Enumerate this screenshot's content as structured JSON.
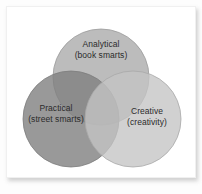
{
  "figure": {
    "name": "triarchic-intelligence-venn-diagram",
    "type": "venn-diagram-three-set",
    "background_color": "#ffffff",
    "panel_color": "#ffffff",
    "panel_border_color": "#f0f0f0",
    "label_text_color": "#2b2b2b"
  },
  "chart_data": {
    "type": "venn",
    "title": "",
    "sets": [
      {
        "id": "analytical",
        "label": "Analytical",
        "sublabel": "(book smarts)",
        "position": "top",
        "fill_color": "#b3b3b3",
        "stroke_color": "#9a9a9a",
        "center": [
          94,
          70
        ],
        "radius": 48
      },
      {
        "id": "practical",
        "label": "Practical",
        "sublabel": "(street smarts)",
        "position": "bottom-left",
        "fill_color": "#8e8e8e",
        "stroke_color": "#7c7c7c",
        "center": [
          64,
          112
        ],
        "radius": 48
      },
      {
        "id": "creative",
        "label": "Creative",
        "sublabel": "(creativity)",
        "position": "bottom-right",
        "fill_color": "#bfbfbf",
        "stroke_color": "#a8a8a8",
        "center": [
          126,
          112
        ],
        "radius": 48
      }
    ],
    "intersection_shading": "multiply-overlap-darkens",
    "center_intersection_color": "#6f6f6f",
    "legend": "none",
    "grid": false
  },
  "labels": {
    "analytical": {
      "line1": "Analytical",
      "line2": "(book smarts)"
    },
    "practical": {
      "line1": "Practical",
      "line2": "(street smarts)"
    },
    "creative": {
      "line1": "Creative",
      "line2": "(creativity)"
    }
  }
}
